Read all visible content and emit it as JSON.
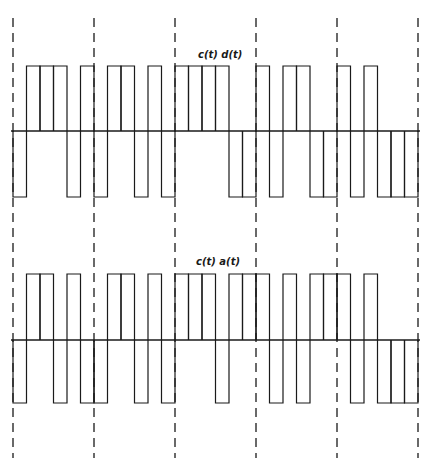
{
  "figure": {
    "bit_period_chips": 6,
    "chip_width_px": 13.5,
    "x_start": 13,
    "dashed_bit_boundaries_x": [
      13,
      94,
      175,
      256,
      337,
      418
    ],
    "colors": {
      "stroke": "#1a1a1a",
      "background": "#ffffff"
    }
  },
  "waveforms": [
    {
      "label": "c(t) d(t)",
      "baseline_y": 131,
      "high_y": 66,
      "low_y": 197,
      "label_x": 198,
      "label_y": 58,
      "chips": [
        -1,
        1,
        1,
        1,
        -1,
        1,
        -1,
        1,
        1,
        -1,
        1,
        -1,
        1,
        1,
        1,
        1,
        -1,
        -1,
        1,
        -1,
        1,
        1,
        -1,
        -1,
        1,
        -1,
        1,
        -1,
        -1,
        -1
      ]
    },
    {
      "label": "c(t) a(t)",
      "baseline_y": 340,
      "high_y": 274,
      "low_y": 403,
      "label_x": 196,
      "label_y": 265,
      "chips": [
        -1,
        1,
        1,
        -1,
        1,
        -1,
        -1,
        1,
        1,
        -1,
        1,
        -1,
        1,
        1,
        1,
        -1,
        1,
        1,
        1,
        -1,
        1,
        -1,
        1,
        1,
        1,
        -1,
        1,
        -1,
        -1,
        -1
      ]
    }
  ]
}
